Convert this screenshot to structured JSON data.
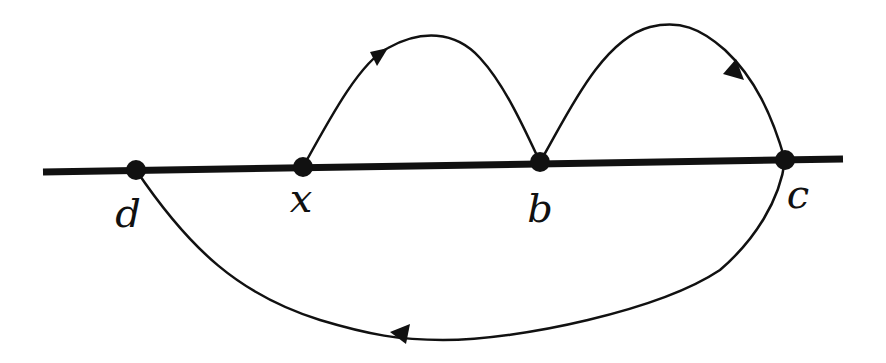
{
  "diagram": {
    "type": "directed-path-on-line",
    "colors": {
      "stroke": "#111111",
      "background": "#ffffff"
    },
    "line": {
      "from": [
        43,
        172
      ],
      "to": [
        843,
        159
      ]
    },
    "points": [
      {
        "id": "d",
        "label": "d",
        "x": 136,
        "y": 170,
        "label_x": 128,
        "label_y": 195
      },
      {
        "id": "x",
        "label": "x",
        "x": 303,
        "y": 167,
        "label_x": 301,
        "label_y": 180
      },
      {
        "id": "b",
        "label": "b",
        "x": 540,
        "y": 162,
        "label_x": 540,
        "label_y": 190
      },
      {
        "id": "c",
        "label": "c",
        "x": 785,
        "y": 160,
        "label_x": 797,
        "label_y": 176
      }
    ],
    "arcs": [
      {
        "from": "x",
        "to": "b",
        "side": "above",
        "arrow_direction": "toward-b"
      },
      {
        "from": "b",
        "to": "c",
        "side": "above",
        "arrow_direction": "toward-c"
      },
      {
        "from": "c",
        "to": "d",
        "side": "below",
        "arrow_direction": "toward-d"
      }
    ]
  }
}
